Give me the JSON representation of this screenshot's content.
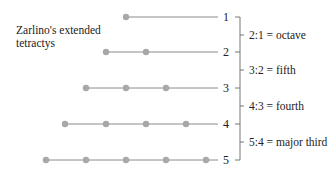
{
  "title_line1": "Zarlino's extended",
  "title_line2": "tetractys",
  "colors": {
    "line": "#8a8a8a",
    "dot": "#a8a8a8",
    "text": "#222222",
    "bracket": "#555555"
  },
  "rows": [
    {
      "label": "1",
      "y": 17,
      "dots": [
        126
      ]
    },
    {
      "label": "2",
      "y": 52,
      "dots": [
        106,
        146
      ]
    },
    {
      "label": "3",
      "y": 88,
      "dots": [
        86,
        126,
        166
      ]
    },
    {
      "label": "4",
      "y": 124,
      "dots": [
        65,
        106,
        146,
        186
      ]
    },
    {
      "label": "5",
      "y": 160,
      "dots": [
        46,
        86,
        126,
        166,
        206
      ]
    }
  ],
  "intervals": [
    {
      "label": "2:1 = octave",
      "y": 35
    },
    {
      "label": "3:2 = fifth",
      "y": 70
    },
    {
      "label": "4:3 = fourth",
      "y": 106
    },
    {
      "label": "5:4 = major third",
      "y": 142
    }
  ]
}
